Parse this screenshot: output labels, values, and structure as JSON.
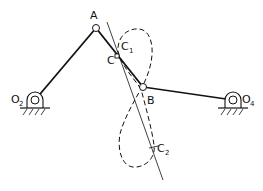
{
  "diagram": {
    "type": "four-bar linkage with coupler curve",
    "labels": {
      "A": "A",
      "B": "B",
      "C": "C",
      "C1_main": "C",
      "C1_sub": "1",
      "C2_main": "C",
      "C2_sub": "2",
      "O2_main": "O",
      "O2_sub": "2",
      "O4_main": "O",
      "O4_sub": "4"
    },
    "colors": {
      "stroke": "#111111",
      "background": "#ffffff"
    },
    "nodes": {
      "O2": [
        35,
        100
      ],
      "A": [
        96,
        28
      ],
      "C": [
        117,
        56
      ],
      "B": [
        143,
        87
      ],
      "O4": [
        233,
        100
      ]
    },
    "links": [
      {
        "from": "O2",
        "to": "A",
        "name": "crank"
      },
      {
        "from": "A",
        "to": "B",
        "name": "coupler"
      },
      {
        "from": "B",
        "to": "O4",
        "name": "rocker"
      }
    ],
    "coupler_curve": {
      "style": "dashed",
      "shape": "figure-eight",
      "points_marked": [
        "C1",
        "C2"
      ]
    },
    "tangent_line": {
      "from": [
        107,
        22
      ],
      "to": [
        163,
        180
      ]
    }
  }
}
